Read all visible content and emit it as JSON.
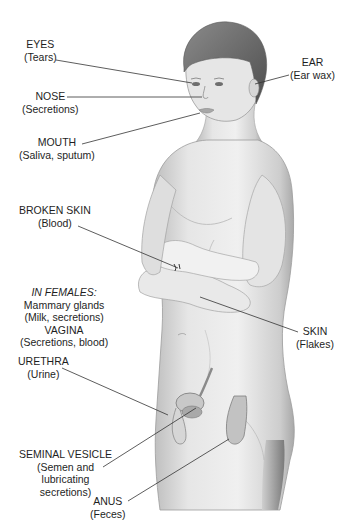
{
  "diagram": {
    "labels": {
      "eyes": {
        "name": "EYES",
        "detail": "(Tears)"
      },
      "ear": {
        "name": "EAR",
        "detail": "(Ear wax)"
      },
      "nose": {
        "name": "NOSE",
        "detail": "(Secretions)"
      },
      "mouth": {
        "name": "MOUTH",
        "detail": "(Saliva, sputum)"
      },
      "broken_skin": {
        "name": "BROKEN SKIN",
        "detail": "(Blood)"
      },
      "females": {
        "heading": "IN FEMALES:",
        "line1": "Mammary glands",
        "line2": "(Milk, secretions)",
        "line3": "VAGINA",
        "line4": "(Secretions, blood)"
      },
      "skin": {
        "name": "SKIN",
        "detail": "(Flakes)"
      },
      "urethra": {
        "name": "URETHRA",
        "detail": "(Urine)"
      },
      "seminal_vesicle": {
        "name": "SEMINAL VESICLE",
        "line1": "(Semen and",
        "line2": "lubricating",
        "line3": "secretions)"
      },
      "anus": {
        "name": "ANUS",
        "detail": "(Feces)"
      }
    },
    "colors": {
      "background": "#ffffff",
      "text": "#1e1e1e",
      "leader_line": "#333333",
      "skin_light": "#ececec",
      "skin_mid": "#cfcfcf",
      "skin_shadow": "#9a9a9a",
      "hair": "#6b6b6b"
    }
  }
}
